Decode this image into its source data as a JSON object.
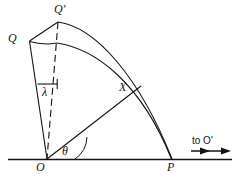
{
  "figure": {
    "type": "geometry-diagram",
    "background_color": "#ffffff",
    "stroke_color": "#141414",
    "labels": [
      {
        "id": "q-prime",
        "text": "Q'",
        "x": 54,
        "y": 4,
        "style": "italic"
      },
      {
        "id": "q",
        "text": "Q",
        "x": 8,
        "y": 33,
        "style": "italic"
      },
      {
        "id": "lambda",
        "text": "λ",
        "x": 42,
        "y": 86,
        "style": "greek"
      },
      {
        "id": "x",
        "text": "X",
        "x": 119,
        "y": 81,
        "style": "italic"
      },
      {
        "id": "theta",
        "text": "θ",
        "x": 62,
        "y": 146,
        "style": "greek"
      },
      {
        "id": "o",
        "text": "O",
        "x": 36,
        "y": 160,
        "style": "italic"
      },
      {
        "id": "p",
        "text": "P",
        "x": 167,
        "y": 160,
        "style": "italic"
      },
      {
        "id": "to-o-prime",
        "text": "to O'",
        "x": 192,
        "y": 136,
        "style": "small"
      }
    ],
    "points": {
      "O": {
        "x": 47,
        "y": 159
      },
      "P": {
        "x": 172,
        "y": 159
      },
      "Q": {
        "x": 29,
        "y": 41
      },
      "Qprime": {
        "x": 58,
        "y": 22
      },
      "X": {
        "x": 134,
        "y": 92
      },
      "innerTop": {
        "x": 57,
        "y": 43
      }
    },
    "geometry": {
      "baseline": {
        "x1": 8,
        "y1": 159,
        "x2": 232,
        "y2": 159
      },
      "outer_arc": "M58,22 Q130,34 172,159",
      "inner_arc": "M57,43 Q128,50 171,159",
      "chord_q_qprime": "M29,41 L58,22",
      "line_q_to_o": "M29,41 L47,159",
      "line_o_to_x": "M47,159 L140,87",
      "chord_q_inner": "M29,41 Q44,44 57,43",
      "dashed_qprime_o": "M58,22 L47,159",
      "lambda_tick": "M38,84 L57,84",
      "lambda_tick_vert": "M57,80 L57,88",
      "theta_arc": "M70,159 A24,24 0 0 1 81,139",
      "arrow_shaft": {
        "x1": 190,
        "y1": 151,
        "x2": 228,
        "y2": 151
      }
    }
  }
}
